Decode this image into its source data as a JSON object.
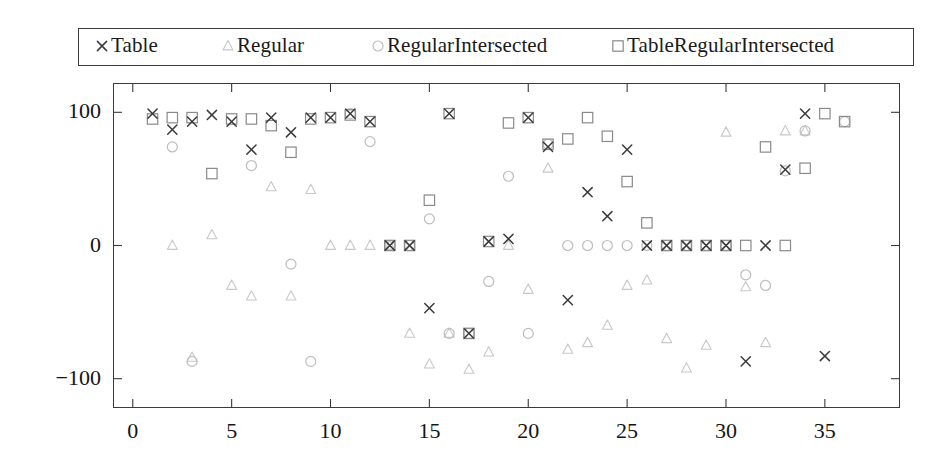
{
  "chart_data": {
    "type": "scatter",
    "title": "",
    "xlabel": "",
    "ylabel": "",
    "xlim": [
      -1,
      38.8
    ],
    "ylim": [
      -122,
      122
    ],
    "xticks": [
      0,
      5,
      10,
      15,
      20,
      25,
      30,
      35
    ],
    "yticks": [
      100,
      0,
      -100
    ],
    "grid": false,
    "legend_position": "top",
    "colors": {
      "table": "#3a3a3a",
      "regular": "#c8c8c8",
      "regular_intersected": "#bdbdbd",
      "table_regular_intersected": "#8a8a8a",
      "frame": "#3a3a3a",
      "background": "#ffffff"
    },
    "series": [
      {
        "name": "Table",
        "marker": "x",
        "points": [
          [
            1,
            99
          ],
          [
            2,
            87
          ],
          [
            3,
            93
          ],
          [
            4,
            98
          ],
          [
            5,
            93
          ],
          [
            6,
            72
          ],
          [
            7,
            96
          ],
          [
            8,
            85
          ],
          [
            9,
            96
          ],
          [
            10,
            96
          ],
          [
            11,
            99
          ],
          [
            12,
            93
          ],
          [
            13,
            0
          ],
          [
            14,
            0
          ],
          [
            15,
            -47
          ],
          [
            16,
            99
          ],
          [
            17,
            -66
          ],
          [
            18,
            3
          ],
          [
            19,
            5
          ],
          [
            20,
            96
          ],
          [
            21,
            74
          ],
          [
            22,
            -41
          ],
          [
            23,
            40
          ],
          [
            24,
            22
          ],
          [
            25,
            72
          ],
          [
            26,
            0
          ],
          [
            27,
            0
          ],
          [
            28,
            0
          ],
          [
            29,
            0
          ],
          [
            30,
            0
          ],
          [
            31,
            -87
          ],
          [
            32,
            0
          ],
          [
            33,
            57
          ],
          [
            34,
            99
          ],
          [
            35,
            -83
          ]
        ]
      },
      {
        "name": "Regular",
        "marker": "triangle",
        "points": [
          [
            2,
            0
          ],
          [
            3,
            -84
          ],
          [
            4,
            8
          ],
          [
            5,
            -30
          ],
          [
            6,
            -38
          ],
          [
            7,
            44
          ],
          [
            8,
            -38
          ],
          [
            9,
            42
          ],
          [
            10,
            0
          ],
          [
            11,
            0
          ],
          [
            12,
            0
          ],
          [
            13,
            0
          ],
          [
            14,
            -66
          ],
          [
            15,
            -89
          ],
          [
            16,
            -66
          ],
          [
            17,
            -93
          ],
          [
            18,
            -80
          ],
          [
            19,
            0
          ],
          [
            20,
            -33
          ],
          [
            21,
            58
          ],
          [
            22,
            -78
          ],
          [
            23,
            -73
          ],
          [
            24,
            -60
          ],
          [
            25,
            -30
          ],
          [
            26,
            -26
          ],
          [
            27,
            -70
          ],
          [
            28,
            -92
          ],
          [
            29,
            -75
          ],
          [
            30,
            85
          ],
          [
            31,
            -31
          ],
          [
            32,
            -73
          ],
          [
            33,
            86
          ],
          [
            34,
            86
          ]
        ]
      },
      {
        "name": "RegularIntersected",
        "marker": "circle",
        "points": [
          [
            2,
            74
          ],
          [
            3,
            -87
          ],
          [
            6,
            60
          ],
          [
            8,
            -14
          ],
          [
            9,
            -87
          ],
          [
            11,
            99
          ],
          [
            12,
            78
          ],
          [
            13,
            0
          ],
          [
            14,
            0
          ],
          [
            15,
            20
          ],
          [
            16,
            -66
          ],
          [
            17,
            -66
          ],
          [
            18,
            -27
          ],
          [
            19,
            52
          ],
          [
            20,
            -66
          ],
          [
            21,
            76
          ],
          [
            22,
            0
          ],
          [
            23,
            0
          ],
          [
            24,
            0
          ],
          [
            25,
            0
          ],
          [
            26,
            0
          ],
          [
            27,
            0
          ],
          [
            28,
            0
          ],
          [
            29,
            0
          ],
          [
            30,
            0
          ],
          [
            31,
            -22
          ],
          [
            32,
            -30
          ],
          [
            33,
            56
          ],
          [
            34,
            86
          ],
          [
            36,
            93
          ]
        ]
      },
      {
        "name": "TableRegularIntersected",
        "marker": "square",
        "points": [
          [
            1,
            95
          ],
          [
            2,
            96
          ],
          [
            3,
            96
          ],
          [
            4,
            54
          ],
          [
            5,
            95
          ],
          [
            6,
            95
          ],
          [
            7,
            90
          ],
          [
            8,
            70
          ],
          [
            9,
            95
          ],
          [
            10,
            96
          ],
          [
            11,
            98
          ],
          [
            12,
            93
          ],
          [
            13,
            0
          ],
          [
            14,
            0
          ],
          [
            15,
            34
          ],
          [
            16,
            99
          ],
          [
            17,
            -66
          ],
          [
            18,
            3
          ],
          [
            19,
            92
          ],
          [
            20,
            96
          ],
          [
            21,
            76
          ],
          [
            22,
            80
          ],
          [
            23,
            96
          ],
          [
            24,
            82
          ],
          [
            25,
            48
          ],
          [
            26,
            17
          ],
          [
            27,
            0
          ],
          [
            28,
            0
          ],
          [
            29,
            0
          ],
          [
            30,
            0
          ],
          [
            31,
            0
          ],
          [
            32,
            74
          ],
          [
            33,
            0
          ],
          [
            34,
            58
          ],
          [
            35,
            99
          ],
          [
            36,
            93
          ]
        ]
      }
    ]
  },
  "legend": {
    "entries": [
      {
        "label": "Table",
        "marker": "x"
      },
      {
        "label": "Regular",
        "marker": "triangle"
      },
      {
        "label": "RegularIntersected",
        "marker": "circle"
      },
      {
        "label": "TableRegularIntersected",
        "marker": "square"
      }
    ]
  },
  "axes": {
    "y_tick_labels": [
      "100",
      "0",
      "−100"
    ],
    "x_tick_labels": [
      "0",
      "5",
      "10",
      "15",
      "20",
      "25",
      "30",
      "35"
    ]
  }
}
